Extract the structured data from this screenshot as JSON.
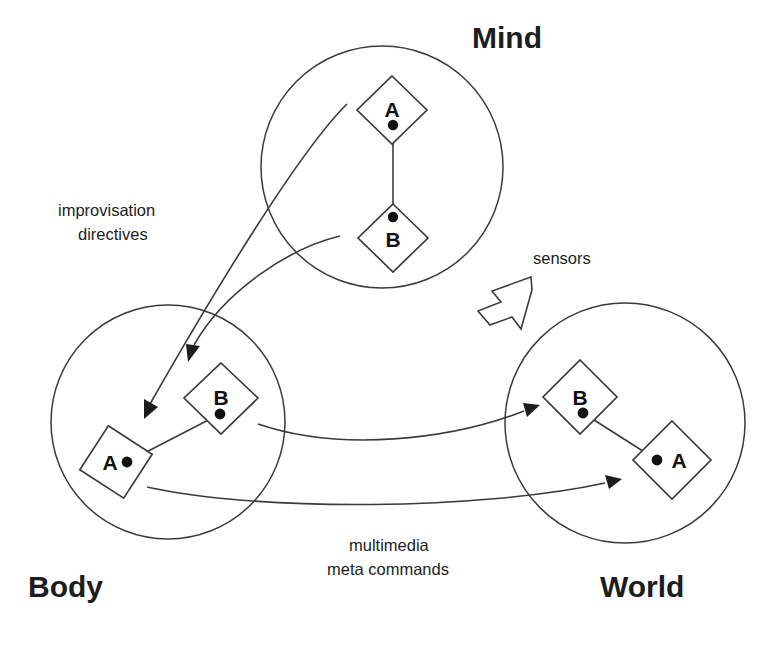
{
  "figure": {
    "title_mind": "Mind",
    "title_body": "Body",
    "title_world": "World"
  },
  "regions": [
    {
      "id": "mind",
      "label": "Mind",
      "nodes": [
        {
          "id": "mind-a",
          "letter": "A"
        },
        {
          "id": "mind-b",
          "letter": "B"
        }
      ]
    },
    {
      "id": "body",
      "label": "Body",
      "nodes": [
        {
          "id": "body-b",
          "letter": "B"
        },
        {
          "id": "body-a",
          "letter": "A"
        }
      ]
    },
    {
      "id": "world",
      "label": "World",
      "nodes": [
        {
          "id": "world-b",
          "letter": "B"
        },
        {
          "id": "world-a",
          "letter": "A"
        }
      ]
    }
  ],
  "edge_labels": {
    "mind_to_body_line1": "improvisation",
    "mind_to_body_line2": "directives",
    "body_to_world_line1": "multimedia",
    "body_to_world_line2": "meta commands",
    "sensors": "sensors"
  },
  "colors": {
    "stroke": "#3b3b3b",
    "text": "#1d1d1d",
    "background": "#ffffff",
    "dot": "#111111"
  }
}
